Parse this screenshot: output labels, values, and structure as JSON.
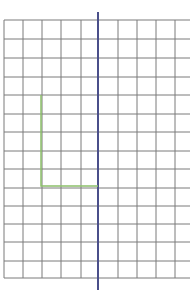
{
  "diagram": {
    "type": "grid-with-axis",
    "background": "#ffffff",
    "grid": {
      "color": "#7a7a7a",
      "x_lines": [
        4,
        23,
        42,
        61,
        81,
        118,
        137,
        156,
        175
      ],
      "x_start": 4,
      "x_end": 190,
      "y_lines": [
        20,
        39,
        58,
        77,
        95,
        114,
        132,
        151,
        169,
        188,
        206,
        224,
        242,
        261,
        278
      ],
      "y_start": 20,
      "y_end": 278
    },
    "axis": {
      "color": "#4a4f8a",
      "x": 98,
      "y_top": 12,
      "y_bottom": 290
    },
    "shape": {
      "color": "#8cc06a",
      "points": [
        [
          41,
          95
        ],
        [
          41,
          186
        ],
        [
          98,
          186
        ]
      ]
    }
  }
}
